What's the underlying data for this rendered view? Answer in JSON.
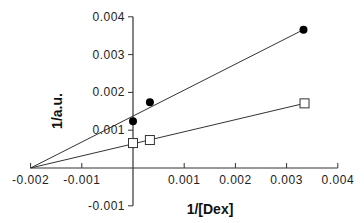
{
  "chart_data": {
    "type": "scatter",
    "title": "",
    "xlabel": "1/[Dex]",
    "ylabel": "1/a.u.",
    "xlim": [
      -0.002,
      0.004
    ],
    "ylim": [
      -0.001,
      0.004
    ],
    "x_ticks": [
      -0.002,
      -0.001,
      0.001,
      0.002,
      0.003,
      0.004
    ],
    "x_tick_labels": [
      "-0.002",
      "-0.001",
      "0.001",
      "0.002",
      "0.003",
      "0.004"
    ],
    "y_ticks": [
      0.004,
      0.003,
      0.002,
      0.001,
      -0.001
    ],
    "y_tick_labels": [
      "0.004",
      "0.003",
      "0.002",
      "0.001",
      "-0.001"
    ],
    "grid": false,
    "legend": null,
    "series": [
      {
        "name": "filled-circles",
        "marker": "filled-circle",
        "points": [
          [
            0.0,
            0.00124
          ],
          [
            0.00033,
            0.00174
          ],
          [
            0.00333,
            0.00366
          ]
        ],
        "fit_line": {
          "from": [
            -0.002,
            0.0
          ],
          "to": [
            0.00333,
            0.00366
          ]
        }
      },
      {
        "name": "open-squares",
        "marker": "open-square",
        "points": [
          [
            0.0,
            0.00066
          ],
          [
            0.00033,
            0.00074
          ],
          [
            0.00335,
            0.00171
          ]
        ],
        "fit_line": {
          "from": [
            -0.002,
            0.0
          ],
          "to": [
            0.00335,
            0.00171
          ]
        }
      }
    ]
  }
}
